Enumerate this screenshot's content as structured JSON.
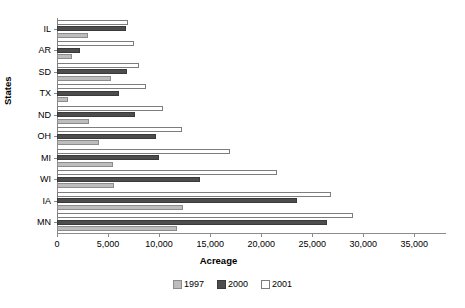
{
  "chart_data": {
    "type": "bar",
    "orientation": "horizontal",
    "title": "",
    "xlabel": "Acreage",
    "ylabel": "States",
    "categories": [
      "IL",
      "AR",
      "SD",
      "TX",
      "ND",
      "OH",
      "MI",
      "WI",
      "IA",
      "MN"
    ],
    "series": [
      {
        "name": "1997",
        "color": "#bdbdbd",
        "values": [
          3000,
          1500,
          5300,
          1100,
          3100,
          4100,
          5500,
          5600,
          12300,
          11800
        ]
      },
      {
        "name": "2000",
        "color": "#4d4d4d",
        "values": [
          6800,
          2300,
          6900,
          6100,
          7600,
          9700,
          10000,
          14000,
          23500,
          26400
        ]
      },
      {
        "name": "2001",
        "color": "#ffffff",
        "values": [
          7000,
          7500,
          8000,
          8700,
          10400,
          12200,
          16900,
          21500,
          26800,
          29000
        ]
      }
    ],
    "xlim": [
      0,
      38000
    ],
    "xticks": [
      0,
      5000,
      10000,
      15000,
      20000,
      25000,
      30000,
      35000
    ],
    "xticklabels": [
      "0",
      "5,000",
      "10,000",
      "15,000",
      "20,000",
      "25,000",
      "30,000",
      "35,000"
    ],
    "grid": false,
    "legend_position": "bottom",
    "legend_entries": [
      "1997",
      "2000",
      "2001"
    ]
  }
}
